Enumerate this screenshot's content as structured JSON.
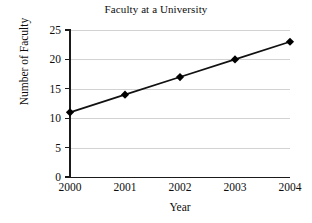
{
  "chart_data": {
    "type": "line",
    "title": "Faculty at a University",
    "xlabel": "Year",
    "ylabel": "Number of Faculty",
    "categories": [
      "2000",
      "2001",
      "2002",
      "2003",
      "2004"
    ],
    "values": [
      11,
      14,
      17,
      20,
      23
    ],
    "series": [
      {
        "name": "Number of Faculty",
        "values": [
          11,
          14,
          17,
          20,
          23
        ]
      }
    ],
    "x": [
      2000,
      2001,
      2002,
      2003,
      2004
    ],
    "ylim": [
      0,
      25
    ],
    "xlim": [
      2000,
      2004
    ],
    "ytick_labels": [
      "0",
      "5",
      "10",
      "15",
      "20",
      "25"
    ],
    "ytick_values": [
      0,
      5,
      10,
      15,
      20,
      25
    ],
    "xtick_labels": [
      "2000",
      "2001",
      "2002",
      "2003",
      "2004"
    ],
    "grid": "horizontal",
    "legend": "none",
    "marker": "diamond",
    "colors": {
      "line": "#111111",
      "marker": "#000000",
      "gridline": "#d2d2d2",
      "axis": "#1a1a1a",
      "text": "#0d0d0d",
      "background": "#ffffff"
    }
  }
}
